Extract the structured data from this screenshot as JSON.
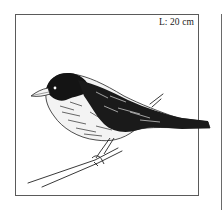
{
  "figure": {
    "size_label": "L: 20 cm",
    "illustration": "bird-on-branch-ink-drawing",
    "colors": {
      "ink": "#111111",
      "frame": "#5a5a5a",
      "background": "#ffffff"
    }
  }
}
